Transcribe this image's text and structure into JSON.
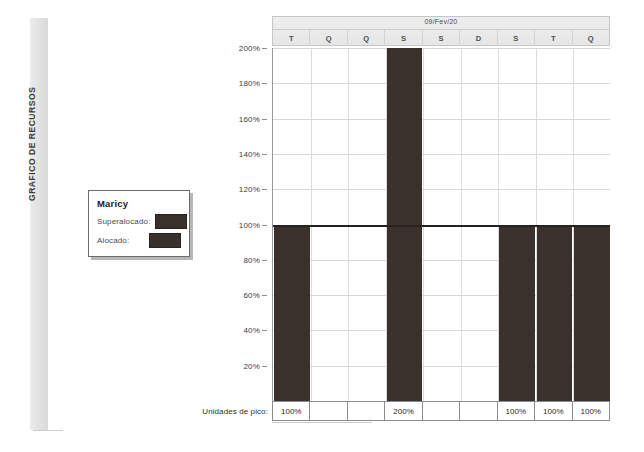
{
  "document": {
    "side_label": "GRAFICO DE RECURSOS"
  },
  "legend": {
    "title": "Maricy",
    "items": [
      {
        "label": "Superalocado:",
        "color": "#3a302c"
      },
      {
        "label": "Alocado:",
        "color": "#3a302c"
      }
    ]
  },
  "timeline": {
    "date": "09/Fev/20",
    "days": [
      "T",
      "Q",
      "Q",
      "S",
      "S",
      "D",
      "S",
      "T",
      "Q"
    ]
  },
  "peak_units": {
    "label": "Unidades de pico:",
    "values": [
      "100%",
      "",
      "",
      "200%",
      "",
      "",
      "100%",
      "100%",
      "100%"
    ]
  },
  "chart_data": {
    "type": "bar",
    "title": "",
    "subtitle": "09/Fev/20",
    "xlabel": "",
    "ylabel": "",
    "categories": [
      "T",
      "Q",
      "Q",
      "S",
      "S",
      "D",
      "S",
      "T",
      "Q"
    ],
    "values": [
      100,
      0,
      0,
      200,
      0,
      0,
      100,
      100,
      100
    ],
    "value_labels": [
      "100%",
      "",
      "",
      "200%",
      "",
      "",
      "100%",
      "100%",
      "100%"
    ],
    "ylim": [
      0,
      200
    ],
    "yticks": [
      20,
      40,
      60,
      80,
      100,
      120,
      140,
      160,
      180,
      200
    ],
    "ytick_labels": [
      "20%",
      "40%",
      "60%",
      "80%",
      "100%",
      "120%",
      "140%",
      "160%",
      "180%",
      "200%"
    ],
    "grid": true,
    "legend_position": "left-outside",
    "series": [
      {
        "name": "Superalocado",
        "color": "#3a302c"
      },
      {
        "name": "Alocado",
        "color": "#3a302c"
      }
    ],
    "annotations": [
      {
        "name": "capacity-line",
        "y": 100,
        "label": "100%",
        "color": "#262220"
      }
    ]
  }
}
